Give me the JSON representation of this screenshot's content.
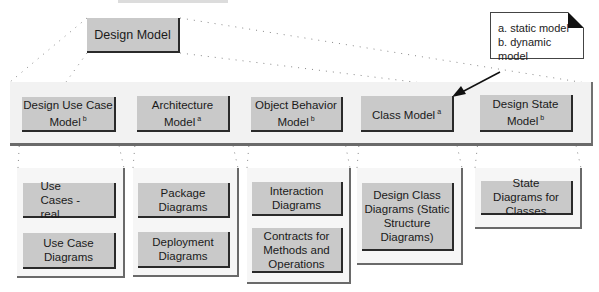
{
  "top_fragment": "(cut-off text)",
  "root": {
    "label": "Design Model"
  },
  "legend": {
    "lines": [
      "a. static model",
      "b. dynamic model"
    ]
  },
  "models": [
    {
      "label": "Design Use Case Model",
      "sup": "b"
    },
    {
      "label": "Architecture Model",
      "sup": "a"
    },
    {
      "label": "Object Behavior Model",
      "sup": "b"
    },
    {
      "label": "Class Model",
      "sup": "a"
    },
    {
      "label": "Design State Model",
      "sup": "b"
    }
  ],
  "artifacts": [
    {
      "items": [
        "Use Cases -real",
        "Use Case Diagrams"
      ]
    },
    {
      "items": [
        "Package Diagrams",
        "Deployment Diagrams"
      ]
    },
    {
      "items": [
        "Interaction Diagrams",
        "Contracts for Methods and Operations"
      ]
    },
    {
      "items": [
        "Design Class Diagrams (Static Structure Diagrams)"
      ]
    },
    {
      "items": [
        "State Diagrams for Classes"
      ]
    }
  ],
  "colors": {
    "box_fill": "#c9c9c9",
    "box_shadow": "#2a2a2a",
    "panel_fill": "#f4f4f4",
    "connector": "#777777"
  }
}
